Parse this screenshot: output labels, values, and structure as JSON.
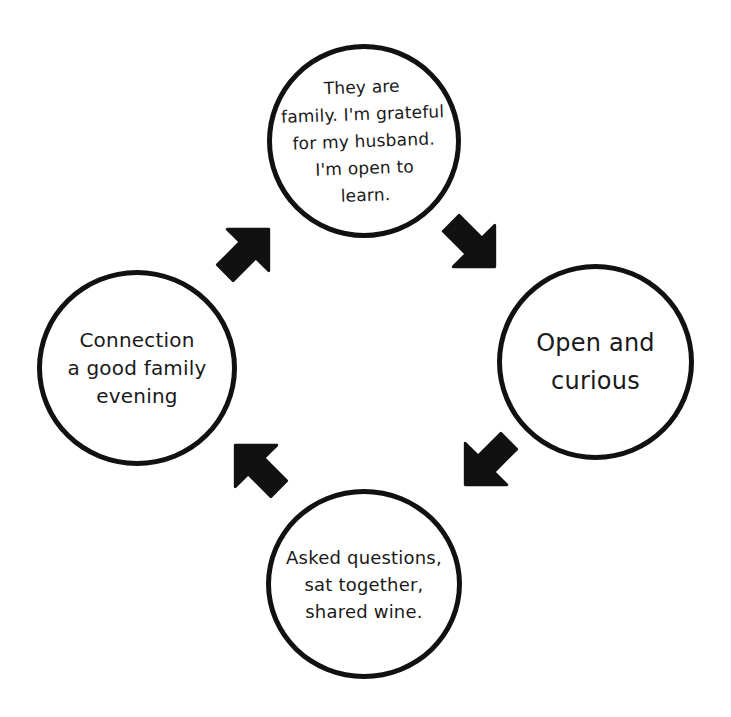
{
  "diagram": {
    "type": "cycle",
    "flow": "clockwise",
    "colors": {
      "stroke": "#111111",
      "background": "#ffffff",
      "text": "#1a1a1a"
    },
    "nodes": [
      {
        "id": "top",
        "position": "top",
        "text": "They are\nfamily. I'm grateful\nfor my husband.\nI'm open to\nlearn."
      },
      {
        "id": "right",
        "position": "right",
        "text": "Open and\ncurious"
      },
      {
        "id": "bottom",
        "position": "bottom",
        "text": "Asked questions,\nsat together,\nshared wine."
      },
      {
        "id": "left",
        "position": "left",
        "text": "Connection\na good family\nevening"
      }
    ],
    "arrows": [
      {
        "from": "top",
        "to": "right",
        "direction": "south-east",
        "icon": "arrow-down-right-icon"
      },
      {
        "from": "right",
        "to": "bottom",
        "direction": "south-west",
        "icon": "arrow-down-left-icon"
      },
      {
        "from": "bottom",
        "to": "left",
        "direction": "north-west",
        "icon": "arrow-up-left-icon"
      },
      {
        "from": "left",
        "to": "top",
        "direction": "north-east",
        "icon": "arrow-up-right-icon"
      }
    ]
  }
}
